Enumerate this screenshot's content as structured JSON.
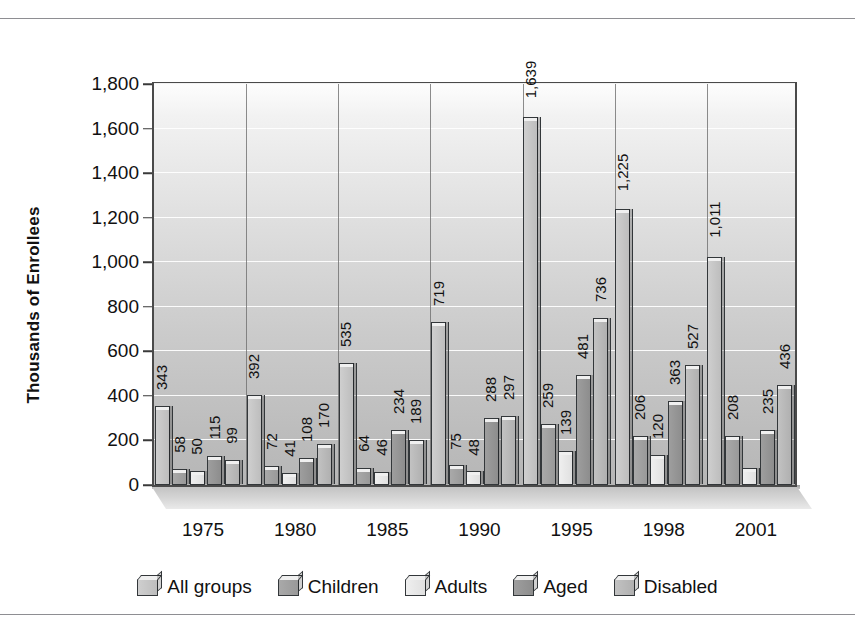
{
  "chart_data": {
    "type": "bar",
    "title": "",
    "xlabel": "",
    "ylabel": "Thousands of Enrollees",
    "categories": [
      "1975",
      "1980",
      "1985",
      "1990",
      "1995",
      "1998",
      "2001"
    ],
    "ylim": [
      0,
      1800
    ],
    "yticks": [
      0,
      200,
      400,
      600,
      800,
      1000,
      1200,
      1400,
      1600,
      1800
    ],
    "ytick_labels": [
      "0",
      "200",
      "400",
      "600",
      "800",
      "1,000",
      "1,200",
      "1,400",
      "1,600",
      "1,800"
    ],
    "grid": true,
    "legend_position": "bottom",
    "series": [
      {
        "name": "All groups",
        "color": "#c4c4c4",
        "values": [
          343,
          392,
          535,
          719,
          1639,
          1225,
          1011
        ],
        "labels": [
          "343",
          "392",
          "535",
          "719",
          "1,639",
          "1,225",
          "1,011"
        ]
      },
      {
        "name": "Children",
        "color": "#a1a1a1",
        "values": [
          58,
          72,
          64,
          75,
          259,
          206,
          208
        ],
        "labels": [
          "58",
          "72",
          "64",
          "75",
          "259",
          "206",
          "208"
        ]
      },
      {
        "name": "Adults",
        "color": "#e7e7e7",
        "values": [
          50,
          41,
          46,
          48,
          139,
          120,
          62
        ],
        "labels": [
          "50",
          "41",
          "46",
          "48",
          "139",
          "120",
          ""
        ]
      },
      {
        "name": "Aged",
        "color": "#959595",
        "values": [
          115,
          108,
          234,
          288,
          481,
          363,
          235
        ],
        "labels": [
          "115",
          "108",
          "234",
          "288",
          "481",
          "363",
          "235"
        ]
      },
      {
        "name": "Disabled",
        "color": "#b9b9b9",
        "values": [
          99,
          170,
          189,
          297,
          736,
          527,
          436
        ],
        "labels": [
          "99",
          "170",
          "189",
          "297",
          "736",
          "527",
          "436"
        ]
      }
    ]
  }
}
